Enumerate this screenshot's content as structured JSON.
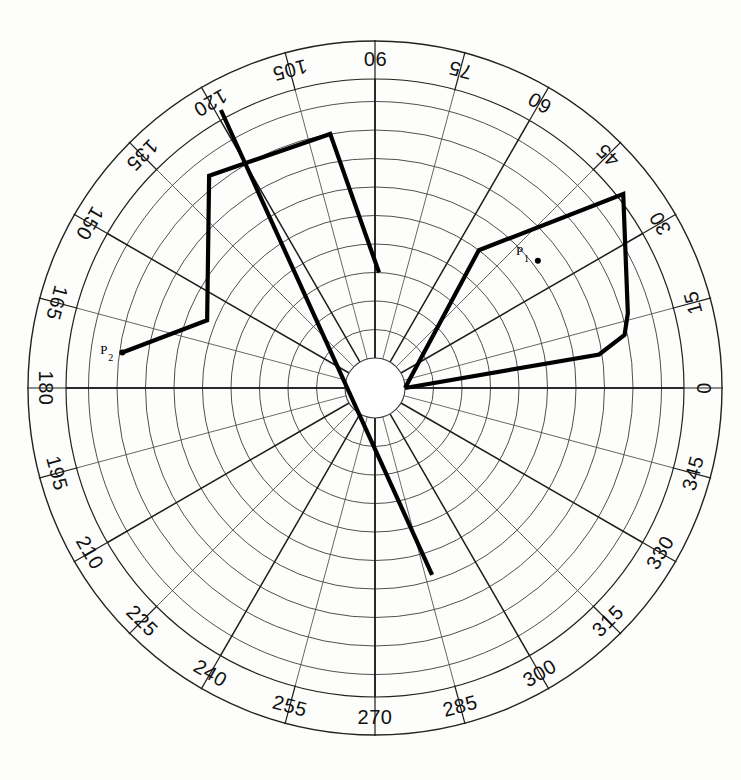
{
  "figure": {
    "title": "",
    "background_color": "#fdfdfb",
    "line_color": "#000000",
    "grid_color": "#3b3b3b"
  },
  "chart_data": {
    "type": "line",
    "projection": "polar",
    "title": "",
    "xlabel": "",
    "ylabel": "",
    "grid": true,
    "legend_position": "none",
    "angular_axis": {
      "unit": "degrees",
      "direction": "counterclockwise",
      "zero_at": "east",
      "tick_step": 15,
      "tick_labels": [
        "0",
        "15",
        "30",
        "45",
        "60",
        "75",
        "90",
        "105",
        "120",
        "135",
        "150",
        "165",
        "180",
        "195",
        "210",
        "225",
        "240",
        "255",
        "270",
        "285",
        "300",
        "315",
        "330",
        "345"
      ],
      "tick_values": [
        0,
        15,
        30,
        45,
        60,
        75,
        90,
        105,
        120,
        135,
        150,
        165,
        180,
        195,
        210,
        225,
        240,
        255,
        270,
        285,
        300,
        315,
        330,
        345
      ]
    },
    "radial_axis": {
      "rings": 11,
      "ring_spacing": 1,
      "inner_hole_rings": 1,
      "rlim": [
        0,
        11
      ],
      "tick_labels_shown": false
    },
    "annotations": [
      {
        "name": "P1",
        "label": "P",
        "subscript": "1",
        "angle_deg": 38.0,
        "radius": 6.2
      },
      {
        "name": "P2",
        "label": "P",
        "subscript": "2",
        "angle_deg": 172.0,
        "radius": 7.9
      }
    ],
    "series": [
      {
        "name": "trace-right",
        "closed": false,
        "points_polar": [
          {
            "angle_deg": 0.0,
            "radius": 0.0
          },
          {
            "angle_deg": 8.5,
            "radius": 6.9
          },
          {
            "angle_deg": 12.0,
            "radius": 7.9
          },
          {
            "angle_deg": 16.5,
            "radius": 8.2
          },
          {
            "angle_deg": 38.0,
            "radius": 10.0
          },
          {
            "angle_deg": 53.0,
            "radius": 5.0
          },
          {
            "angle_deg": 0.0,
            "radius": 0.0
          }
        ]
      },
      {
        "name": "trace-left",
        "closed": false,
        "points_polar": [
          {
            "angle_deg": 88.0,
            "radius": 3.0
          },
          {
            "angle_deg": 100.0,
            "radius": 8.0
          },
          {
            "angle_deg": 128.0,
            "radius": 8.4
          },
          {
            "angle_deg": 158.0,
            "radius": 5.3
          },
          {
            "angle_deg": 172.0,
            "radius": 7.9
          }
        ]
      },
      {
        "name": "trace-diagonal",
        "closed": false,
        "points_polar": [
          {
            "angle_deg": 119.0,
            "radius": 10.1
          },
          {
            "angle_deg": 287.0,
            "radius": 5.8
          }
        ]
      }
    ]
  },
  "geometry": {
    "center_x": 375,
    "center_y": 388,
    "outer_radius": 347,
    "band_inner_radius": 309,
    "hole_radius": 30,
    "ring_step": 28.5
  }
}
